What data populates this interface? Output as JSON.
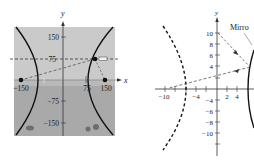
{
  "left_panel": {
    "axis_labels": {
      "x": "x",
      "y": "y"
    },
    "y_ticks": [
      "150",
      "75",
      "−75",
      "−150"
    ],
    "x_ticks": [
      "−150",
      "75",
      "150"
    ],
    "points": [
      {
        "name": "left-focus",
        "x": -150,
        "y": 0
      },
      {
        "name": "right-focus",
        "x": 150,
        "y": 0
      },
      {
        "name": "reflection-point",
        "x": 100,
        "y": 75
      }
    ],
    "background": {
      "sky": "#c9c9c9",
      "ground": "#a8a8a8"
    }
  },
  "right_panel": {
    "axis_labels": {
      "y": "y"
    },
    "y_ticks": [
      "10",
      "8",
      "6",
      "4",
      "−4",
      "−6",
      "−8",
      "−10"
    ],
    "x_ticks": [
      "−10",
      "−4",
      "2",
      "4"
    ],
    "mirror_label": "Mirro",
    "colors": {
      "ink": "#222222"
    }
  }
}
